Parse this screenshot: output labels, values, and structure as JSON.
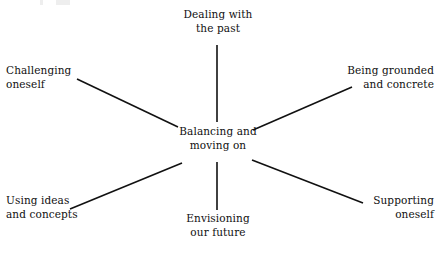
{
  "diagram": {
    "type": "mind-map",
    "title": "Balancing and moving on",
    "background_color": "#ffffff",
    "line_color": "#111111",
    "text_color": "#101010",
    "center": {
      "label": "Balancing and\nmoving on",
      "x": 218,
      "y": 142
    },
    "nodes": [
      {
        "id": "dealing-with-the-past",
        "label": "Dealing with\nthe past",
        "position": "top",
        "align": "center",
        "x": 218,
        "y": 25
      },
      {
        "id": "being-grounded-and-concrete",
        "label": "Being grounded\nand concrete",
        "position": "top-right",
        "align": "right",
        "x": 434,
        "y": 80
      },
      {
        "id": "supporting-oneself",
        "label": "Supporting\noneself",
        "position": "bottom-right",
        "align": "right",
        "x": 434,
        "y": 210
      },
      {
        "id": "envisioning-our-future",
        "label": "Envisioning\nour future",
        "position": "bottom",
        "align": "center",
        "x": 218,
        "y": 228
      },
      {
        "id": "using-ideas-and-concepts",
        "label": "Using ideas\nand concepts",
        "position": "bottom-left",
        "align": "left",
        "x": 6,
        "y": 210
      },
      {
        "id": "challenging-oneself",
        "label": "Challenging\noneself",
        "position": "top-left",
        "align": "left",
        "x": 6,
        "y": 80
      }
    ],
    "connectors": [
      {
        "id": "connector-top",
        "from": "center",
        "to": "dealing-with-the-past",
        "x1": 217,
        "y1": 122,
        "x2": 217,
        "y2": 45
      },
      {
        "id": "connector-top-right",
        "from": "center",
        "to": "being-grounded-and-concrete",
        "x1": 253,
        "y1": 130,
        "x2": 352,
        "y2": 87
      },
      {
        "id": "connector-bottom-right",
        "from": "center",
        "to": "supporting-oneself",
        "x1": 252,
        "y1": 160,
        "x2": 363,
        "y2": 203
      },
      {
        "id": "connector-bottom",
        "from": "center",
        "to": "envisioning-our-future",
        "x1": 217,
        "y1": 162,
        "x2": 217,
        "y2": 210
      },
      {
        "id": "connector-bottom-left",
        "from": "center",
        "to": "using-ideas-and-concepts",
        "x1": 182,
        "y1": 163,
        "x2": 70,
        "y2": 209
      },
      {
        "id": "connector-top-left",
        "from": "center",
        "to": "challenging-oneself",
        "x1": 178,
        "y1": 127,
        "x2": 77,
        "y2": 79
      }
    ]
  }
}
